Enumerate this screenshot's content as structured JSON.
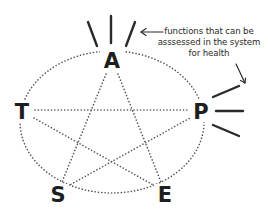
{
  "diagram": {
    "type": "pentagram-in-ellipse",
    "colors": {
      "ink": "#1e1e1e",
      "dotted": "#555555",
      "background": "#ffffff"
    },
    "nodes": [
      {
        "id": "A",
        "label": "A",
        "x": 112,
        "y": 60
      },
      {
        "id": "P",
        "label": "P",
        "x": 201,
        "y": 111
      },
      {
        "id": "E",
        "label": "E",
        "x": 165,
        "y": 194
      },
      {
        "id": "S",
        "label": "S",
        "x": 58,
        "y": 194
      },
      {
        "id": "T",
        "label": "T",
        "x": 22,
        "y": 111
      }
    ],
    "edges_star": [
      [
        "A",
        "S"
      ],
      [
        "A",
        "E"
      ],
      [
        "T",
        "P"
      ],
      [
        "T",
        "E"
      ],
      [
        "S",
        "P"
      ]
    ],
    "edges_ellipse": "dotted ellipse passing through all five nodes",
    "function_lines": {
      "A": 3,
      "P": 3
    },
    "annotation": {
      "lines": [
        "functions that can be",
        "asssessed in the system",
        "for health"
      ]
    }
  }
}
